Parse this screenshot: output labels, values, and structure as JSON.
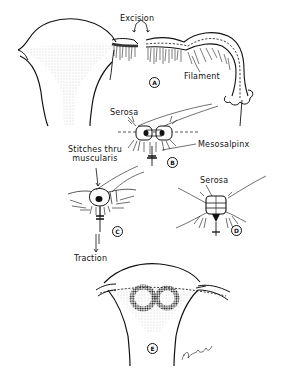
{
  "figure": {
    "panels": [
      {
        "id": "A",
        "badge": "A",
        "labels": [
          "Excision",
          "Filament"
        ]
      },
      {
        "id": "B",
        "badge": "B",
        "labels": [
          "Serosa",
          "Mesosalpinx"
        ]
      },
      {
        "id": "C",
        "badge": "C",
        "labels": [
          "Stitches thru muscularis",
          "Traction"
        ]
      },
      {
        "id": "D",
        "badge": "D",
        "labels": [
          "Serosa"
        ]
      },
      {
        "id": "E",
        "badge": "E",
        "labels": []
      }
    ]
  },
  "labels": {
    "excision": "Excision",
    "filament": "Filament",
    "serosa_b": "Serosa",
    "mesosalpinx": "Mesosalpinx",
    "stitches_line1": "Stitches thru",
    "stitches_line2": "muscularis",
    "serosa_d": "Serosa",
    "traction": "Traction"
  },
  "badges": {
    "a": "A",
    "b": "B",
    "c": "C",
    "d": "D",
    "e": "E"
  },
  "colors": {
    "ink": "#111111",
    "stipple": "#bdbdbd",
    "background": "#ffffff"
  }
}
